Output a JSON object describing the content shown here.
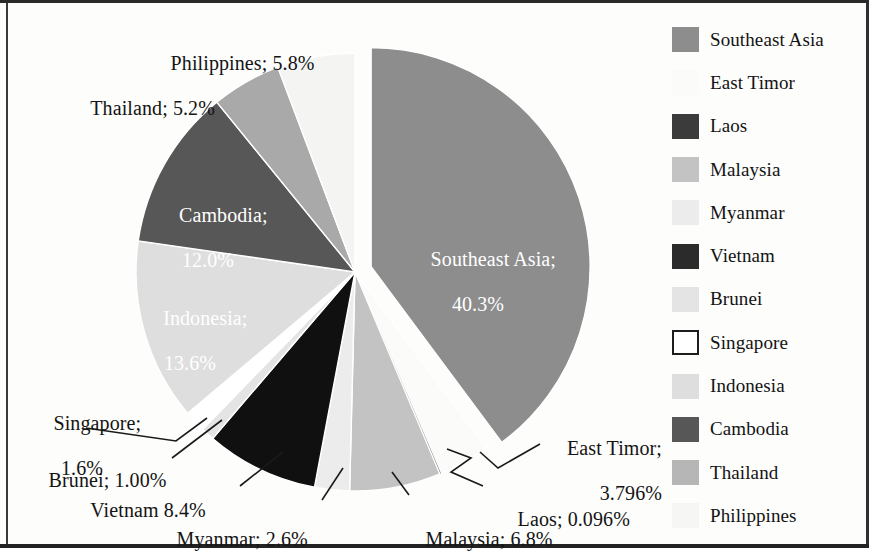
{
  "chart_data": {
    "type": "pie",
    "title": "",
    "legend_position": "right",
    "exploded_slice": "Southeast Asia",
    "start_angle_deg": 0,
    "direction": "clockwise",
    "categories": [
      "Southeast Asia",
      "East Timor",
      "Laos",
      "Malaysia",
      "Myanmar",
      "Vietnam",
      "Brunei",
      "Singapore",
      "Indonesia",
      "Cambodia",
      "Thailand",
      "Philippines"
    ],
    "values": [
      40.3,
      3.796,
      0.096,
      6.8,
      2.6,
      8.4,
      1.0,
      1.6,
      13.6,
      12.0,
      5.2,
      5.8
    ],
    "value_labels": [
      "40.3%",
      "3.796%",
      "0.096%",
      "6.8%",
      "2.6%",
      "8.4%",
      "1.00%",
      "1.6%",
      "13.6%",
      "12.0%",
      "5.2%",
      "5.8%"
    ],
    "colors": [
      "#8d8d8d",
      "#fbfbfa",
      "#3b3b3b",
      "#c3c3c3",
      "#ececec",
      "#101010",
      "#e4e4e4",
      "#ffffff",
      "#dedede",
      "#575757",
      "#a9a9a9",
      "#f4f4f3"
    ],
    "slices": [
      {
        "name": "Southeast Asia",
        "value": 40.3,
        "label": "Southeast Asia;",
        "value_label": "40.3%",
        "color": "#8d8d8d",
        "exploded": true,
        "label_placement": "inside"
      },
      {
        "name": "East Timor",
        "value": 3.796,
        "label": "East Timor;",
        "value_label": "3.796%",
        "color": "#fbfbfa",
        "exploded": false,
        "label_placement": "outside-leader"
      },
      {
        "name": "Laos",
        "value": 0.096,
        "label": "Laos;",
        "value_label": "0.096%",
        "color": "#3b3b3b",
        "exploded": false,
        "label_placement": "outside-leader"
      },
      {
        "name": "Malaysia",
        "value": 6.8,
        "label": "Malaysia;",
        "value_label": "6.8%",
        "color": "#c3c3c3",
        "exploded": false,
        "label_placement": "outside-leader"
      },
      {
        "name": "Myanmar",
        "value": 2.6,
        "label": "Myanmar;",
        "value_label": "2.6%",
        "color": "#ececec",
        "exploded": false,
        "label_placement": "outside-leader"
      },
      {
        "name": "Vietnam",
        "value": 8.4,
        "label": "Vietnam",
        "value_label": "8.4%",
        "color": "#101010",
        "exploded": false,
        "label_placement": "outside-leader"
      },
      {
        "name": "Brunei",
        "value": 1.0,
        "label": "Brunei;",
        "value_label": "1.00%",
        "color": "#e4e4e4",
        "exploded": false,
        "label_placement": "outside-leader"
      },
      {
        "name": "Singapore",
        "value": 1.6,
        "label": "Singapore;",
        "value_label": "1.6%",
        "color": "#ffffff",
        "exploded": false,
        "label_placement": "outside-leader"
      },
      {
        "name": "Indonesia",
        "value": 13.6,
        "label": "Indonesia;",
        "value_label": "13.6%",
        "color": "#dedede",
        "exploded": false,
        "label_placement": "inside"
      },
      {
        "name": "Cambodia",
        "value": 12.0,
        "label": "Cambodia;",
        "value_label": "12.0%",
        "color": "#575757",
        "exploded": false,
        "label_placement": "inside"
      },
      {
        "name": "Thailand",
        "value": 5.2,
        "label": "Thailand;",
        "value_label": "5.2%",
        "color": "#a9a9a9",
        "exploded": false,
        "label_placement": "outside"
      },
      {
        "name": "Philippines",
        "value": 5.8,
        "label": "Philippines;",
        "value_label": "5.8%",
        "color": "#f4f4f3",
        "exploded": false,
        "label_placement": "outside"
      }
    ]
  },
  "labels": {
    "philippines": {
      "line1": "Philippines; 5.8%"
    },
    "thailand": {
      "line1": "Thailand; 5.2%"
    },
    "cambodia": {
      "line1": "Cambodia;",
      "line2": "12.0%"
    },
    "indonesia": {
      "line1": "Indonesia;",
      "line2": "13.6%"
    },
    "southeast_asia": {
      "line1": "Southeast Asia;",
      "line2": "40.3%"
    },
    "singapore": {
      "line1": "Singapore;",
      "line2": "1.6%"
    },
    "brunei": {
      "line1": "Brunei; 1.00%"
    },
    "vietnam": {
      "line1": "Vietnam 8.4%"
    },
    "myanmar": {
      "line1": "Myanmar; 2.6%"
    },
    "malaysia": {
      "line1": "Malaysia; 6.8%"
    },
    "laos": {
      "line1": "Laos; 0.096%"
    },
    "east_timor": {
      "line1": "East Timor;",
      "line2": "3.796%"
    }
  },
  "legend": {
    "items": [
      {
        "label": "Southeast Asia",
        "color": "#8d8d8d",
        "outlined": false
      },
      {
        "label": "East Timor",
        "color": "#fbfbfa",
        "outlined": false
      },
      {
        "label": "Laos",
        "color": "#3b3b3b",
        "outlined": false
      },
      {
        "label": "Malaysia",
        "color": "#c3c3c3",
        "outlined": false
      },
      {
        "label": "Myanmar",
        "color": "#ececec",
        "outlined": false
      },
      {
        "label": "Vietnam",
        "color": "#2b2b2b",
        "outlined": false
      },
      {
        "label": "Brunei",
        "color": "#e4e4e4",
        "outlined": false
      },
      {
        "label": "Singapore",
        "color": "#ffffff",
        "outlined": true
      },
      {
        "label": "Indonesia",
        "color": "#dedede",
        "outlined": false
      },
      {
        "label": "Cambodia",
        "color": "#575757",
        "outlined": false
      },
      {
        "label": "Thailand",
        "color": "#b6b6b6",
        "outlined": false
      },
      {
        "label": "Philippines",
        "color": "#f6f6f5",
        "outlined": false
      }
    ]
  }
}
